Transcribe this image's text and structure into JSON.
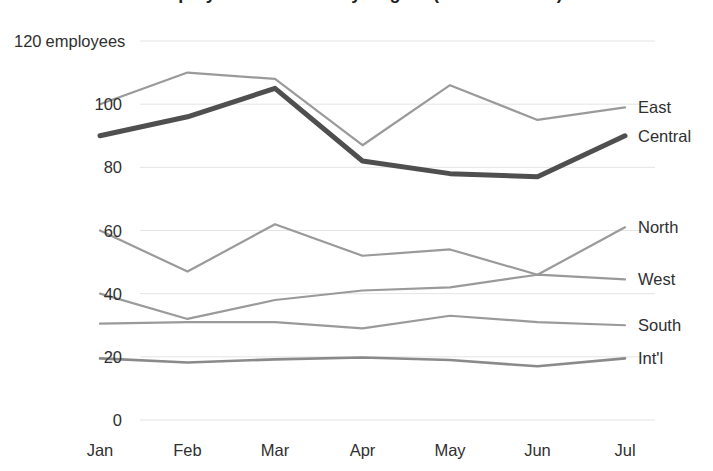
{
  "chart_data": {
    "type": "line",
    "title": "Employee Headcount by Region (2024 first half)",
    "title_clipped": true,
    "xlabel": "",
    "ylabel": "employees",
    "y_unit_label": "employees",
    "x": [
      "Jan",
      "Feb",
      "Mar",
      "Apr",
      "May",
      "Jun",
      "Jul"
    ],
    "categories": [
      "Jan",
      "Feb",
      "Mar",
      "Apr",
      "May",
      "Jun",
      "Jul"
    ],
    "ylim": [
      0,
      120
    ],
    "yticks": [
      0,
      20,
      40,
      60,
      80,
      100,
      120
    ],
    "ytick_labels": [
      "0",
      "20",
      "40",
      "60",
      "80",
      "100",
      "120"
    ],
    "grid": true,
    "grid_axis": "y",
    "legend_position": "right-inline",
    "series": [
      {
        "name": "East",
        "values": [
          100,
          110,
          108,
          87,
          106,
          95,
          99
        ],
        "color": "#9a9a9a",
        "width": 2.2
      },
      {
        "name": "Central",
        "values": [
          90,
          96,
          105,
          82,
          78,
          77,
          90
        ],
        "color": "#4f4f4f",
        "width": 5.0
      },
      {
        "name": "North",
        "values": [
          60,
          47,
          62,
          52,
          54,
          46,
          61
        ],
        "color": "#9a9a9a",
        "width": 2.2
      },
      {
        "name": "West",
        "values": [
          40,
          32,
          38,
          41,
          42,
          46,
          44.5
        ],
        "color": "#9a9a9a",
        "width": 2.2
      },
      {
        "name": "South",
        "values": [
          30.5,
          31,
          31,
          29,
          33,
          31,
          30
        ],
        "color": "#9a9a9a",
        "width": 2.2
      },
      {
        "name": "Int'l",
        "values": [
          19.5,
          18.2,
          19.2,
          19.8,
          19,
          17,
          19.5
        ],
        "color": "#8a8a8a",
        "width": 2.6
      }
    ]
  },
  "axis": {
    "y_top_label_number": "120",
    "y_top_label_unit": "employees"
  },
  "colors": {
    "background": "#ffffff",
    "gridline": "#e4e4e4",
    "text": "#2f2f2f",
    "series_light": "#9a9a9a",
    "series_dark": "#4f4f4f"
  }
}
